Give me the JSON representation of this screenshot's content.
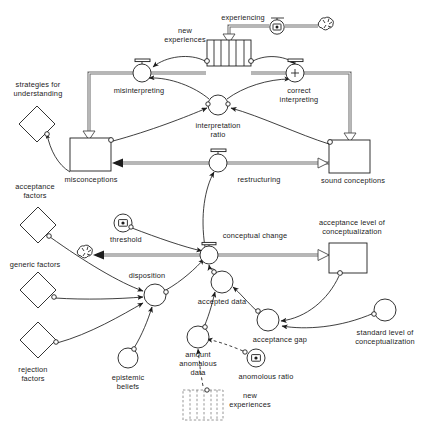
{
  "diagram": {
    "type": "system-dynamics-stock-and-flow",
    "background_color": "#ffffff",
    "line_color": "#1d1d1d",
    "pipe_color": "#6f6f6f"
  },
  "labels": {
    "experiencing": "experiencing",
    "new_experiences": "new experiences",
    "new_experiences_l1": "new",
    "new_experiences_l2": "experiences",
    "misinterpreting": "misinterpreting",
    "correct_interpreting_l1": "correct",
    "correct_interpreting_l2": "interpreting",
    "interpretation_ratio_l1": "interpretation",
    "interpretation_ratio_l2": "ratio",
    "strategies_l1": "strategies  for",
    "strategies_l2": "understanding",
    "misconceptions": "misconceptions",
    "sound_conceptions": "sound conceptions",
    "restructuring": "restructuring",
    "acceptance_factors_l1": "acceptance",
    "acceptance_factors_l2": "factors",
    "generic_factors": "generic factors",
    "rejection_factors_l1": "rejection",
    "rejection_factors_l2": "factors",
    "threshold": "threshold",
    "disposition": "disposition",
    "epistemic_beliefs_l1": "epistemic",
    "epistemic_beliefs_l2": "beliefs",
    "conceptual_change": "conceptual change",
    "accepted_data": "accepted data",
    "acceptance_gap": "acceptance gap",
    "amount_anomalous_l1": "amount",
    "amount_anomalous_l2": "anomalous",
    "amount_anomalous_l3": "data",
    "anomalous_ratio": "anomolous ratio",
    "acceptance_level_l1": "acceptance level of",
    "acceptance_level_l2": "conceptualization",
    "standard_level_l1": "standard level of",
    "standard_level_l2": "conceptualization",
    "new_experiences_ghost_l1": "new",
    "new_experiences_ghost_l2": "experiences"
  },
  "nodes": {
    "stocks": [
      {
        "name": "new experiences",
        "kind": "conveyor-stock",
        "x": 207,
        "y": 40,
        "w": 44,
        "h": 26
      },
      {
        "name": "misconceptions",
        "kind": "stock",
        "x": 70,
        "y": 138,
        "w": 41,
        "h": 33
      },
      {
        "name": "sound conceptions",
        "kind": "stock",
        "x": 329,
        "y": 140,
        "w": 41,
        "h": 33
      },
      {
        "name": "acceptance level of conceptualization",
        "kind": "stock",
        "x": 329,
        "y": 243,
        "w": 38,
        "h": 30
      },
      {
        "name": "new experiences",
        "kind": "ghost-stock",
        "x": 183,
        "y": 390,
        "w": 40,
        "h": 30
      }
    ],
    "flows": [
      {
        "name": "experiencing",
        "cx": 277,
        "cy": 28,
        "r": 7,
        "glyph": "constant"
      },
      {
        "name": "misinterpreting",
        "cx": 142,
        "cy": 73,
        "r": 9,
        "glyph": "none"
      },
      {
        "name": "correct interpreting",
        "cx": 295,
        "cy": 73,
        "r": 9,
        "glyph": "plus"
      },
      {
        "name": "restructuring",
        "cx": 218,
        "cy": 163,
        "r": 9,
        "glyph": "none"
      },
      {
        "name": "conceptual change",
        "cx": 209,
        "cy": 255,
        "r": 9,
        "glyph": "none"
      }
    ],
    "auxiliaries": [
      {
        "name": "interpretation ratio",
        "cx": 218,
        "cy": 105,
        "r": 10
      },
      {
        "name": "threshold",
        "cx": 123,
        "cy": 223,
        "r": 9,
        "glyph": "constant"
      },
      {
        "name": "disposition",
        "cx": 155,
        "cy": 295,
        "r": 11
      },
      {
        "name": "epistemic beliefs",
        "cx": 128,
        "cy": 358,
        "r": 10
      },
      {
        "name": "accepted data",
        "cx": 222,
        "cy": 282,
        "r": 11
      },
      {
        "name": "acceptance gap",
        "cx": 268,
        "cy": 320,
        "r": 11
      },
      {
        "name": "amount anomalous data",
        "cx": 198,
        "cy": 337,
        "r": 11
      },
      {
        "name": "anomolous ratio",
        "cx": 256,
        "cy": 358,
        "r": 9,
        "glyph": "constant"
      },
      {
        "name": "standard level of conceptualization",
        "cx": 385,
        "cy": 310,
        "r": 11
      }
    ],
    "diamonds": [
      {
        "name": "strategies for understanding",
        "cx": 37,
        "cy": 124,
        "r": 18
      },
      {
        "name": "acceptance factors",
        "cx": 38,
        "cy": 225,
        "r": 18
      },
      {
        "name": "generic factors",
        "cx": 38,
        "cy": 290,
        "r": 18
      },
      {
        "name": "rejection factors",
        "cx": 38,
        "cy": 340,
        "r": 18
      }
    ],
    "clouds": [
      {
        "name": "experiencing source cloud",
        "cx": 326,
        "cy": 25
      },
      {
        "name": "conceptual change sink cloud",
        "cx": 85,
        "cy": 253
      }
    ]
  },
  "connections": [
    {
      "from": "cloud-source",
      "to": "experiencing",
      "kind": "flow"
    },
    {
      "from": "experiencing",
      "to": "new experiences",
      "kind": "flow"
    },
    {
      "from": "new experiences",
      "to": "misinterpreting",
      "kind": "info"
    },
    {
      "from": "new experiences",
      "to": "correct interpreting",
      "kind": "info"
    },
    {
      "from": "misinterpreting",
      "to": "misconceptions",
      "kind": "flow"
    },
    {
      "from": "correct interpreting",
      "to": "sound conceptions",
      "kind": "flow"
    },
    {
      "from": "interpretation ratio",
      "to": "misinterpreting",
      "kind": "info"
    },
    {
      "from": "interpretation ratio",
      "to": "correct interpreting",
      "kind": "info"
    },
    {
      "from": "misconceptions",
      "to": "interpretation ratio",
      "kind": "info"
    },
    {
      "from": "sound conceptions",
      "to": "interpretation ratio",
      "kind": "info"
    },
    {
      "from": "sound conceptions",
      "to": "restructuring",
      "kind": "flow"
    },
    {
      "from": "restructuring",
      "to": "misconceptions",
      "kind": "flow"
    },
    {
      "from": "misconceptions",
      "to": "strategies for understanding",
      "kind": "info"
    },
    {
      "from": "conceptual change",
      "to": "restructuring",
      "kind": "info"
    },
    {
      "from": "threshold",
      "to": "conceptual change",
      "kind": "info"
    },
    {
      "from": "disposition",
      "to": "conceptual change",
      "kind": "info"
    },
    {
      "from": "accepted data",
      "to": "conceptual change",
      "kind": "info"
    },
    {
      "from": "conceptual change",
      "to": "acceptance level of conceptualization",
      "kind": "flow"
    },
    {
      "from": "conceptual change",
      "to": "cloud-sink",
      "kind": "flow"
    },
    {
      "from": "acceptance factors",
      "to": "disposition",
      "kind": "info"
    },
    {
      "from": "generic factors",
      "to": "disposition",
      "kind": "info"
    },
    {
      "from": "rejection factors",
      "to": "disposition",
      "kind": "info"
    },
    {
      "from": "epistemic beliefs",
      "to": "disposition",
      "kind": "info"
    },
    {
      "from": "acceptance gap",
      "to": "accepted data",
      "kind": "info"
    },
    {
      "from": "amount anomalous data",
      "to": "accepted data",
      "kind": "info"
    },
    {
      "from": "acceptance level of conceptualization",
      "to": "acceptance gap",
      "kind": "info"
    },
    {
      "from": "standard level of conceptualization",
      "to": "acceptance gap",
      "kind": "info"
    },
    {
      "from": "anomolous ratio",
      "to": "amount anomalous data",
      "kind": "info-dashed"
    },
    {
      "from": "new experiences ghost",
      "to": "amount anomalous data",
      "kind": "info-dashed"
    }
  ]
}
